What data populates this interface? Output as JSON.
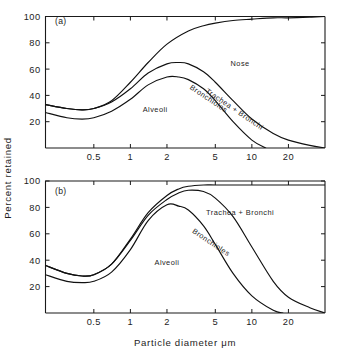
{
  "figure": {
    "x_axis_title": "Particle diameter μm",
    "y_axis_title": "Percent retained"
  },
  "panels": {
    "a": {
      "label": "(a)",
      "y_ticks": [
        "100",
        "80",
        "60",
        "40",
        "20"
      ],
      "x_ticks": [
        "0.5",
        "1",
        "2",
        "5",
        "10",
        "20"
      ],
      "regions": {
        "nose": "Nose",
        "alveoli": "Alveoli",
        "bronchioles": "Bronchioles",
        "trachea_bronchi": "Trachea + Bronchi"
      }
    },
    "b": {
      "label": "(b)",
      "y_ticks": [
        "100",
        "80",
        "60",
        "40",
        "20"
      ],
      "x_ticks": [
        "0.5",
        "1",
        "2",
        "5",
        "10",
        "20"
      ],
      "regions": {
        "alveoli": "Alveoli",
        "bronchioles": "Bronchioles",
        "trachea_bronchi": "Trachea + Bronchi"
      }
    }
  },
  "chart_data": [
    {
      "type": "line",
      "title": "(a)",
      "xlabel": "Particle diameter μm",
      "ylabel": "Percent retained",
      "xscale": "log",
      "xlim": [
        0.2,
        40
      ],
      "ylim": [
        0,
        100
      ],
      "xticks": [
        0.5,
        1,
        2,
        5,
        10,
        20
      ],
      "yticks": [
        20,
        40,
        60,
        80,
        100
      ],
      "grid": false,
      "legend": "inline-annotations",
      "annotations": [
        {
          "text": "Nose",
          "x": 8.0,
          "y": 62
        },
        {
          "text": "Alveoli",
          "x": 1.6,
          "y": 27
        },
        {
          "text": "Bronchioles",
          "x": 4.3,
          "y": 36,
          "rotated": true
        },
        {
          "text": "Trachea + Bronchi",
          "x": 7.0,
          "y": 28,
          "rotated": true
        },
        {
          "text": "(a)",
          "x": 0.24,
          "y": 94
        }
      ],
      "series": [
        {
          "name": "Nose",
          "x": [
            0.2,
            0.3,
            0.4,
            0.5,
            0.7,
            1.0,
            1.4,
            2.0,
            3.0,
            4.0,
            5.0,
            7.0,
            10.0,
            15.0,
            20.0,
            30.0,
            40.0
          ],
          "values": [
            33,
            30,
            29,
            30,
            36,
            50,
            65,
            79,
            89,
            93,
            95,
            97,
            98,
            99,
            99,
            99.5,
            100
          ]
        },
        {
          "name": "Trachea + Bronchi",
          "x": [
            0.2,
            0.3,
            0.4,
            0.5,
            0.7,
            1.0,
            1.4,
            2.0,
            2.5,
            3.0,
            4.0,
            5.0,
            7.0,
            10.0,
            15.0,
            20.0,
            30.0,
            40.0
          ],
          "values": [
            33,
            30,
            29,
            30,
            35,
            45,
            57,
            64,
            65,
            64,
            58,
            50,
            36,
            22,
            11,
            6,
            2,
            0
          ]
        },
        {
          "name": "Bronchioles",
          "x": [
            0.2,
            0.3,
            0.4,
            0.5,
            0.7,
            1.0,
            1.4,
            2.0,
            2.5,
            3.0,
            4.0,
            5.0,
            7.0,
            10.0,
            13.0,
            15.0
          ],
          "values": [
            27,
            23,
            22,
            23,
            28,
            37,
            48,
            54,
            54,
            52,
            45,
            36,
            20,
            6,
            0,
            0
          ]
        }
      ]
    },
    {
      "type": "line",
      "title": "(b)",
      "xlabel": "Particle diameter μm",
      "ylabel": "Percent retained",
      "xscale": "log",
      "xlim": [
        0.2,
        40
      ],
      "ylim": [
        0,
        100
      ],
      "xticks": [
        0.5,
        1,
        2,
        5,
        10,
        20
      ],
      "yticks": [
        20,
        40,
        60,
        80,
        100
      ],
      "grid": false,
      "legend": "inline-annotations",
      "annotations": [
        {
          "text": "Trachea + Bronchi",
          "x": 8.0,
          "y": 74
        },
        {
          "text": "Alveoli",
          "x": 2.0,
          "y": 36
        },
        {
          "text": "Bronchioles",
          "x": 4.5,
          "y": 52,
          "rotated": true
        },
        {
          "text": "(b)",
          "x": 0.24,
          "y": 90
        }
      ],
      "series": [
        {
          "name": "Trachea + Bronchi",
          "x": [
            0.2,
            0.3,
            0.4,
            0.5,
            0.7,
            1.0,
            1.4,
            2.0,
            2.5,
            3.0,
            4.0,
            5.0,
            7.0,
            10.0,
            15.0,
            20.0,
            30.0,
            40.0
          ],
          "values": [
            36,
            30,
            28,
            29,
            37,
            56,
            76,
            89,
            94,
            96,
            97,
            97,
            97,
            97,
            97,
            97,
            97,
            97
          ]
        },
        {
          "name": "Bronchioles",
          "x": [
            0.2,
            0.3,
            0.4,
            0.5,
            0.7,
            1.0,
            1.4,
            2.0,
            2.5,
            3.0,
            4.0,
            5.0,
            7.0,
            10.0,
            15.0,
            20.0,
            30.0,
            40.0
          ],
          "values": [
            36,
            30,
            28,
            29,
            37,
            55,
            74,
            86,
            91,
            93,
            92,
            87,
            73,
            50,
            24,
            12,
            4,
            0
          ]
        },
        {
          "name": "Alveoli",
          "x": [
            0.2,
            0.3,
            0.4,
            0.5,
            0.7,
            1.0,
            1.4,
            2.0,
            2.5,
            3.0,
            4.0,
            5.0,
            7.0,
            10.0,
            15.0,
            18.0,
            20.0
          ],
          "values": [
            29,
            24,
            23,
            24,
            31,
            48,
            70,
            82,
            81,
            78,
            66,
            52,
            30,
            13,
            2,
            0,
            0
          ]
        }
      ]
    }
  ]
}
